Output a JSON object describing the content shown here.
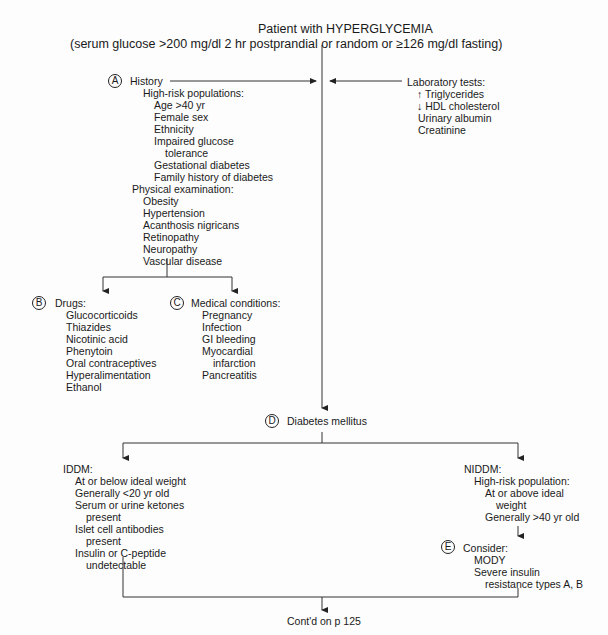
{
  "title": {
    "line1": "Patient with HYPERGLYCEMIA",
    "line2": "(serum glucose >200 mg/dl 2 hr postprandial or random or ≥126 mg/dl fasting)"
  },
  "node_a": {
    "marker": "A",
    "heading": "History",
    "high_risk_heading": "High-risk populations:",
    "high_risk_items": [
      "Age >40 yr",
      "Female sex",
      "Ethnicity",
      "Impaired glucose",
      "tolerance",
      "Gestational diabetes",
      "Family history of diabetes"
    ],
    "physical_heading": "Physical examination:",
    "physical_items": [
      "Obesity",
      "Hypertension",
      "Acanthosis nigricans",
      "Retinopathy",
      "Neuropathy",
      "Vascular disease"
    ]
  },
  "lab_tests": {
    "heading": "Laboratory tests:",
    "items": [
      "↑ Triglycerides",
      "↓ HDL cholesterol",
      "Urinary albumin",
      "Creatinine"
    ]
  },
  "node_b": {
    "marker": "B",
    "heading": "Drugs:",
    "items": [
      "Glucocorticoids",
      "Thiazides",
      "Nicotinic acid",
      "Phenytoin",
      "Oral contraceptives",
      "Hyperalimentation",
      "Ethanol"
    ]
  },
  "node_c": {
    "marker": "C",
    "heading": "Medical conditions:",
    "items": [
      "Pregnancy",
      "Infection",
      "GI bleeding",
      "Myocardial",
      "infarction",
      "Pancreatitis"
    ]
  },
  "node_d": {
    "marker": "D",
    "label": "Diabetes mellitus"
  },
  "iddm": {
    "heading": "IDDM:",
    "items": [
      "At or below ideal weight",
      "Generally <20 yr old",
      "Serum or urine ketones",
      "present",
      "Islet cell antibodies",
      "present",
      "Insulin or C-peptide",
      "undetectable"
    ]
  },
  "niddm": {
    "heading": "NIDDM:",
    "subheading": "High-risk population:",
    "items": [
      "At or above ideal",
      "weight",
      "Generally >40 yr old"
    ]
  },
  "node_e": {
    "marker": "E",
    "heading": "Consider:",
    "items": [
      "MODY",
      "Severe insulin",
      "resistance types A, B"
    ]
  },
  "footer": {
    "continued": "Cont'd on p 125"
  }
}
